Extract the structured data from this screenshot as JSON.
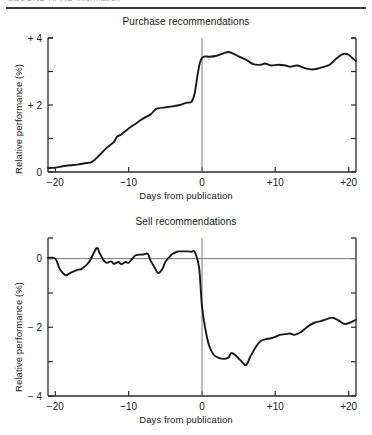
{
  "header": {
    "text_left": "SECOND-HAND information",
    "text_clipped": true,
    "note": "running head clipped at top edge"
  },
  "figure": {
    "axis_color": "#2b2b2b",
    "line_color": "#1a1a1a",
    "zero_line_color": "#7a7a7a",
    "background": "#ffffff"
  },
  "chart_data": [
    {
      "type": "line",
      "title": "Purchase recommendations",
      "xlabel": "Days from publication",
      "ylabel": "Relative performance (%)",
      "xlim": [
        -21,
        21
      ],
      "ylim": [
        0,
        4
      ],
      "xticks": [
        -20,
        -10,
        0,
        10,
        20
      ],
      "xticklabels": [
        "−20",
        "−10",
        "0",
        "+10",
        "+20"
      ],
      "yticks": [
        0,
        1,
        2,
        3,
        4
      ],
      "yticklabels": [
        "0",
        "",
        "+ 2",
        "",
        "+ 4"
      ],
      "grid": false,
      "legend": null,
      "annotations": [
        {
          "kind": "vertical-line",
          "x": 0,
          "label": "publication day"
        }
      ],
      "x": [
        -21,
        -20,
        -19,
        -18,
        -17,
        -16,
        -15,
        -14,
        -13,
        -12,
        -11.6,
        -11,
        -10,
        -9,
        -8,
        -7,
        -6.4,
        -6,
        -5,
        -4,
        -3,
        -2.4,
        -2,
        -1.4,
        -1,
        -0.6,
        -0.3,
        0,
        0.4,
        1,
        2,
        3,
        3.6,
        4.4,
        5,
        6,
        7,
        8,
        8.6,
        9.4,
        10.4,
        11.4,
        12,
        13,
        14,
        15,
        16,
        16.6,
        17.4,
        18.4,
        19.2,
        20,
        20.6,
        21
      ],
      "y": [
        0.12,
        0.13,
        0.17,
        0.2,
        0.22,
        0.26,
        0.3,
        0.5,
        0.72,
        0.9,
        1.05,
        1.12,
        1.3,
        1.45,
        1.6,
        1.72,
        1.86,
        1.9,
        1.93,
        1.96,
        2.0,
        2.05,
        2.07,
        2.1,
        2.35,
        2.9,
        3.25,
        3.4,
        3.45,
        3.44,
        3.47,
        3.55,
        3.58,
        3.52,
        3.45,
        3.35,
        3.22,
        3.2,
        3.24,
        3.18,
        3.2,
        3.18,
        3.14,
        3.18,
        3.1,
        3.06,
        3.1,
        3.14,
        3.2,
        3.4,
        3.52,
        3.5,
        3.38,
        3.32
      ]
    },
    {
      "type": "line",
      "title": "Sell recommendations",
      "xlabel": "Days from publication",
      "ylabel": "Relative performance (%)",
      "xlim": [
        -21,
        21
      ],
      "ylim": [
        -4,
        0.6
      ],
      "xticks": [
        -20,
        -10,
        0,
        10,
        20
      ],
      "xticklabels": [
        "−20",
        "−10",
        "0",
        "+10",
        "+20"
      ],
      "yticks": [
        -4,
        -3,
        -2,
        -1,
        0
      ],
      "yticklabels": [
        "− 4",
        "",
        "− 2",
        "",
        "0"
      ],
      "grid": false,
      "legend": null,
      "annotations": [
        {
          "kind": "vertical-line",
          "x": 0,
          "label": "publication day"
        },
        {
          "kind": "horizontal-line",
          "y": 0,
          "label": "zero performance"
        }
      ],
      "x": [
        -21,
        -20,
        -19.4,
        -18.6,
        -18,
        -17,
        -16.4,
        -15.4,
        -14.4,
        -14,
        -13.4,
        -13,
        -12.4,
        -12,
        -11.4,
        -11,
        -10.4,
        -10,
        -9.4,
        -9,
        -8,
        -7.4,
        -7,
        -6.4,
        -6,
        -5.4,
        -5,
        -4.4,
        -4,
        -3.4,
        -3,
        -2,
        -1.4,
        -1,
        -0.4,
        0,
        0.5,
        1,
        1.6,
        2.2,
        3,
        3.6,
        4,
        4.6,
        5.2,
        6,
        6.6,
        7.4,
        8,
        8.6,
        9.4,
        10,
        10.6,
        11.4,
        12,
        12.6,
        13.4,
        14,
        14.6,
        15.4,
        16.2,
        17,
        17.8,
        18.6,
        19.4,
        20,
        20.6,
        21
      ],
      "y": [
        0.02,
        0.0,
        -0.3,
        -0.48,
        -0.42,
        -0.33,
        -0.3,
        -0.1,
        0.3,
        0.18,
        -0.05,
        -0.12,
        -0.08,
        -0.15,
        -0.1,
        -0.16,
        -0.1,
        -0.12,
        0.02,
        0.1,
        0.12,
        0.14,
        -0.06,
        -0.28,
        -0.42,
        -0.3,
        -0.1,
        0.06,
        0.14,
        0.2,
        0.21,
        0.21,
        0.2,
        0.2,
        -0.25,
        -1.4,
        -2.1,
        -2.55,
        -2.8,
        -2.88,
        -2.92,
        -2.88,
        -2.75,
        -2.82,
        -2.95,
        -3.1,
        -2.85,
        -2.55,
        -2.4,
        -2.35,
        -2.32,
        -2.28,
        -2.22,
        -2.2,
        -2.18,
        -2.22,
        -2.15,
        -2.05,
        -1.95,
        -1.86,
        -1.82,
        -1.76,
        -1.72,
        -1.8,
        -1.9,
        -1.88,
        -1.82,
        -1.78
      ]
    }
  ]
}
